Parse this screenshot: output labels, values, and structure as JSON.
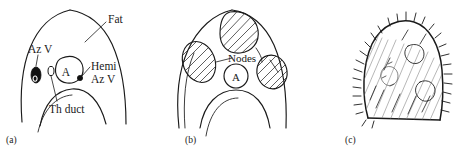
{
  "figure": {
    "background_color": "#ffffff",
    "ink_color": "#1a1a1a",
    "panel_count": 3
  },
  "panels": [
    {
      "id": "a",
      "id_label": "(a)",
      "caption": "normal anatomy with fat, azygos vein, hemiazygos vein, thoracic duct and aorta",
      "labels": [
        {
          "name": "fat",
          "text": "Fat"
        },
        {
          "name": "azygos",
          "text": "Az V"
        },
        {
          "name": "aorta",
          "text": "A"
        },
        {
          "name": "hemi-line1",
          "text": "Hemi"
        },
        {
          "name": "hemi-line2",
          "text": "Az V"
        },
        {
          "name": "thoracic-duct",
          "text": "Th duct"
        }
      ]
    },
    {
      "id": "b",
      "id_label": "(b)",
      "caption": "enlarged hatched lymph nodes surrounding the aorta",
      "labels": [
        {
          "name": "nodes",
          "text": "Nodes"
        },
        {
          "name": "aorta",
          "text": "A"
        }
      ]
    },
    {
      "id": "c",
      "id_label": "(c)",
      "caption": "infiltrated spiculated mass with irregular bristled margin",
      "labels": []
    }
  ],
  "colors": {
    "ink": "#1a1a1a",
    "hatch": "#2a2a2a",
    "sketch": "#7a7a7a",
    "fill_dark": "#111111",
    "background": "#ffffff"
  }
}
